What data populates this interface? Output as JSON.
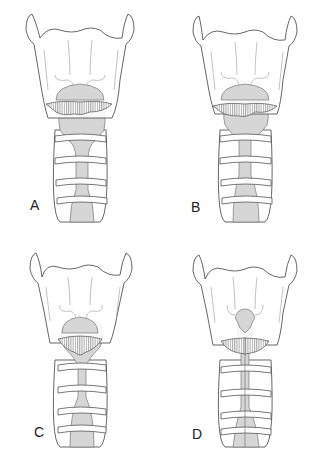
{
  "figure": {
    "panels": [
      {
        "id": "A",
        "label": "A"
      },
      {
        "id": "B",
        "label": "B"
      },
      {
        "id": "C",
        "label": "C"
      },
      {
        "id": "D",
        "label": "D"
      }
    ]
  },
  "colors": {
    "outline": "#555555",
    "airway_fill": "#d6d6d6",
    "background": "#ffffff",
    "label": "#222222"
  }
}
